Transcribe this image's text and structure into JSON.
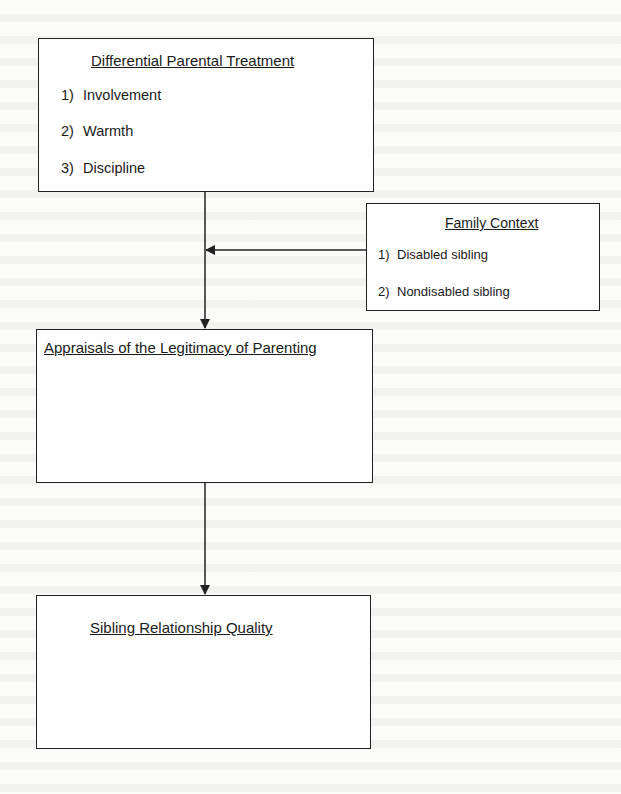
{
  "diagram": {
    "type": "flow",
    "nodes": {
      "treatment": {
        "title": "Differential Parental Treatment",
        "items": [
          {
            "num": "1)",
            "label": "Involvement"
          },
          {
            "num": "2)",
            "label": "Warmth"
          },
          {
            "num": "3)",
            "label": "Discipline"
          }
        ]
      },
      "context": {
        "title": "Family Context",
        "items": [
          {
            "num": "1)",
            "label": "Disabled sibling"
          },
          {
            "num": "2)",
            "label": "Nondisabled sibling"
          }
        ]
      },
      "appraisals": {
        "title": "Appraisals of the Legitimacy of Parenting"
      },
      "quality": {
        "title": "Sibling Relationship Quality"
      }
    },
    "edges": [
      {
        "from": "Differential Parental Treatment",
        "to": "Appraisals of the Legitimacy of Parenting"
      },
      {
        "from": "Family Context",
        "to": "Differential Parental Treatment → Appraisals path (moderator)"
      },
      {
        "from": "Appraisals of the Legitimacy of Parenting",
        "to": "Sibling Relationship Quality"
      }
    ],
    "colors": {
      "line": "#222222",
      "box_fill": "#ffffff",
      "page": "#fbfbfa"
    }
  }
}
